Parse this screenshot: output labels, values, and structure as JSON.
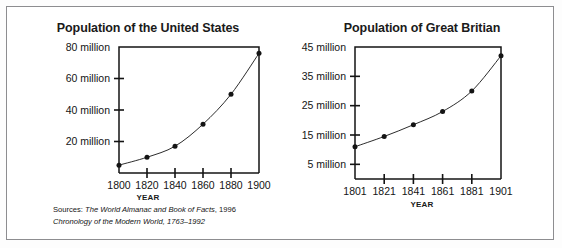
{
  "figure": {
    "border_color": "#8d8d90",
    "background": "#ffffff",
    "ink_color": "#141414"
  },
  "sources": {
    "prefix": "Sources:",
    "line1_italic": "The World Almanac and Book of Facts",
    "line1_year": ", 1996",
    "line2_italic": "Chronology of the Modern World, 1763–1992"
  },
  "chart_data": [
    {
      "type": "line",
      "id": "us",
      "title": "Population of the United States",
      "xlabel": "YEAR",
      "ylabel": "",
      "x": [
        1800,
        1820,
        1840,
        1860,
        1880,
        1900
      ],
      "values": [
        5,
        10,
        17,
        31,
        50,
        76
      ],
      "categories": [
        "1800",
        "1820",
        "1840",
        "1860",
        "1880",
        "1900"
      ],
      "xtick_labels": [
        "1800",
        "1820",
        "1840",
        "1860",
        "1880",
        "1900"
      ],
      "ytick_labels": [
        "20 million",
        "40 million",
        "60 million",
        "80 million"
      ],
      "ytick_values": [
        20,
        40,
        60,
        80
      ],
      "xlim": [
        1800,
        1900
      ],
      "ylim": [
        0,
        80
      ],
      "grid": false,
      "legend": false,
      "marker": "filled-circle",
      "line_color": "#141414"
    },
    {
      "type": "line",
      "id": "gb",
      "title": "Population of Great Britian",
      "xlabel": "YEAR",
      "ylabel": "",
      "x": [
        1801,
        1821,
        1841,
        1861,
        1881,
        1901
      ],
      "values": [
        11,
        14.5,
        18.5,
        23,
        30,
        42
      ],
      "categories": [
        "1801",
        "1821",
        "1841",
        "1861",
        "1881",
        "1901"
      ],
      "xtick_labels": [
        "1801",
        "1821",
        "1841",
        "1861",
        "1881",
        "1901"
      ],
      "ytick_labels": [
        "5 million",
        "15 million",
        "25 million",
        "35 million",
        "45 million"
      ],
      "ytick_values": [
        5,
        15,
        25,
        35,
        45
      ],
      "xlim": [
        1801,
        1901
      ],
      "ylim": [
        0,
        45
      ],
      "grid": false,
      "legend": false,
      "marker": "filled-circle",
      "line_color": "#141414"
    }
  ]
}
